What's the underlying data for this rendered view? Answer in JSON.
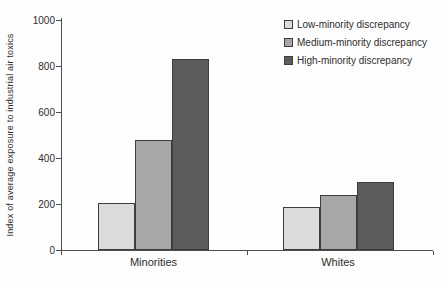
{
  "chart_data": {
    "type": "bar",
    "title": "",
    "ylabel": "Index of average exposure to industrial air toxics",
    "xlabel": "",
    "categories": [
      "Minorities",
      "Whites"
    ],
    "series": [
      {
        "name": "Low-minority discrepancy",
        "color": "#dbdbdb",
        "values": [
          205,
          185
        ]
      },
      {
        "name": "Medium-minority discrepancy",
        "color": "#a7a7a7",
        "values": [
          480,
          240
        ]
      },
      {
        "name": "High-minority discrepancy",
        "color": "#5c5c5c",
        "values": [
          830,
          295
        ]
      }
    ],
    "ylim": [
      0,
      1000
    ],
    "yticks": [
      0,
      200,
      400,
      600,
      800,
      1000
    ],
    "grid": false,
    "legend_position": "top-right",
    "bar_border_color": "#3d3d3d",
    "axis_color": "#4d4d4d",
    "text_color": "#2e2e2e",
    "background": "#fdfdfd"
  }
}
